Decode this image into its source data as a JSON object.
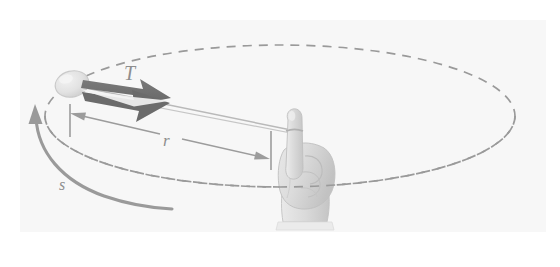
{
  "figure": {
    "background_color": "#ffffff",
    "panel_color": "#f7f7f7",
    "labels": {
      "tension": "T",
      "radius": "r",
      "arc": "s"
    },
    "colors": {
      "tension_arrow": "#6f6f6f",
      "tension_arrow_highlight": "#f2f2f2",
      "dashed_circle": "#9a9a9a",
      "dimension_line": "#9a9a9a",
      "arc_arrow": "#9a9a9a",
      "label_text": "#8e8e8e",
      "ball_fill": "#e3e3e3",
      "ball_stroke": "#c9c9c9",
      "hand_fill": "#dedede",
      "hand_stroke": "#c4c4c4",
      "string": "#b5b5b5"
    },
    "elements": {
      "ball": "ball",
      "hand": "hand-holding-string",
      "finger": "index-finger",
      "string": "string",
      "circle_path": "dashed-orbit-circle",
      "tension_arrow": "tension-vector-arrow",
      "radius_dimension": "radius-dimension-line",
      "arc_arrow": "arc-direction-arrow"
    }
  }
}
